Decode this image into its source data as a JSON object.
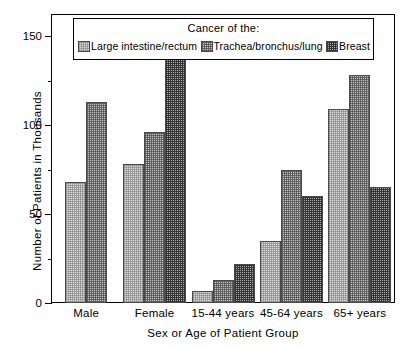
{
  "chart_data": {
    "type": "bar",
    "title": "",
    "xlabel": "Sex or Age of Patient Group",
    "ylabel": "Number of Patients in Thousands",
    "categories": [
      "Male",
      "Female",
      "15-44 years",
      "45-64 years",
      "65+ years"
    ],
    "series": [
      {
        "name": "Large intestine/rectum",
        "values": [
          68,
          78,
          7,
          35,
          109
        ],
        "color": "#dcdcdc"
      },
      {
        "name": "Trachea/bronchus/lung",
        "values": [
          113,
          96,
          13,
          75,
          128
        ],
        "color": "#c2c2c2"
      },
      {
        "name": "Breast",
        "values": [
          null,
          138,
          22,
          60,
          65
        ],
        "color": "#a8a8a8"
      }
    ],
    "ylim": [
      0,
      162
    ],
    "ytick_values": [
      0,
      50,
      100,
      150
    ],
    "ytick_labels": [
      "0",
      "50",
      "100",
      "150"
    ],
    "yminor_values": [
      25,
      75,
      125
    ],
    "grid": false,
    "legend_position": "top-inside",
    "legend_title": "Cancer of the:"
  },
  "legend": {
    "title": "Cancer of the:",
    "entries": [
      {
        "label": "Large intestine/rectum",
        "swatch": "fill-light"
      },
      {
        "label": "Trachea/bronchus/lung",
        "swatch": "fill-medium"
      },
      {
        "label": "Breast",
        "swatch": "fill-dark"
      }
    ]
  }
}
